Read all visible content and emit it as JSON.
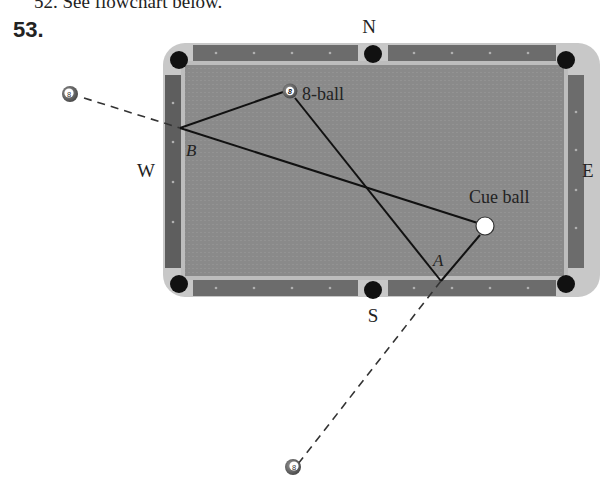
{
  "problem": {
    "previous_line_fragment": "52. See flowchart below.",
    "number": "53."
  },
  "compass": {
    "north": "N",
    "south": "S",
    "east": "E",
    "west": "W"
  },
  "labels": {
    "eight_ball": "8-ball",
    "cue_ball": "Cue ball",
    "point_a": "A",
    "point_b": "B",
    "ball_number": "8"
  },
  "colors": {
    "felt": "#8a8a8a",
    "rail": "#6e6e6e",
    "rail_edge": "#c4c4c4",
    "pocket": "#111111",
    "line": "#111111"
  }
}
